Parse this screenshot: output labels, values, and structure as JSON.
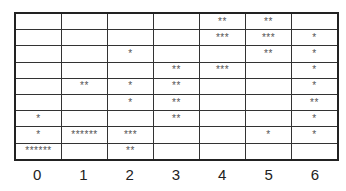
{
  "chart_data": {
    "type": "table",
    "title": "",
    "xlabel": "",
    "ylabel": "",
    "categories": [
      "0",
      "1",
      "2",
      "3",
      "4",
      "5",
      "6"
    ],
    "rows": [
      [
        "",
        "",
        "",
        "",
        "**",
        "**",
        ""
      ],
      [
        "",
        "",
        "",
        "",
        "***",
        "***",
        "*"
      ],
      [
        "",
        "",
        "*",
        "",
        "",
        "**",
        "*"
      ],
      [
        "",
        "",
        "",
        "**",
        "***",
        "",
        "*"
      ],
      [
        "",
        "**",
        "*",
        "**",
        "",
        "",
        "*"
      ],
      [
        "",
        "",
        "*",
        "**",
        "",
        "",
        "**"
      ],
      [
        "*",
        "",
        "",
        "**",
        "",
        "",
        "*"
      ],
      [
        "*",
        "******",
        "***",
        "",
        "",
        "*",
        "*"
      ],
      [
        "******",
        "",
        "**",
        "",
        "",
        "",
        ""
      ]
    ],
    "column_totals": [
      8,
      8,
      7,
      8,
      8,
      8,
      8
    ],
    "grid": true
  }
}
